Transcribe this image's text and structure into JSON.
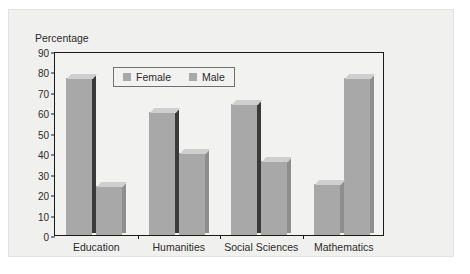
{
  "chart_data": {
    "type": "bar",
    "title": "",
    "xlabel": "",
    "ylabel": "Percentage",
    "ylim": [
      0,
      90
    ],
    "yticks": [
      90,
      80,
      70,
      60,
      50,
      40,
      30,
      20,
      10,
      0
    ],
    "grid": false,
    "legend_position": "top-left-inside",
    "categories": [
      "Education",
      "Humanities",
      "Social Sciences",
      "Mathematics"
    ],
    "series": [
      {
        "name": "Female",
        "values": [
          77,
          60,
          64,
          25
        ],
        "color": "#a8a8a8"
      },
      {
        "name": "Male",
        "values": [
          24,
          40,
          36,
          77
        ],
        "color": "#a8a8a8"
      }
    ]
  },
  "axis": {
    "y_title": "Percentage",
    "tick_labels": [
      "90",
      "80",
      "70",
      "60",
      "50",
      "40",
      "30",
      "20",
      "10",
      "0"
    ]
  },
  "legend": {
    "items": [
      {
        "label": "Female"
      },
      {
        "label": "Male"
      }
    ]
  },
  "colors": {
    "bar_face": "#a8a8a8",
    "bar_top": "#cfcfcf",
    "bar_side": "#8e8e8e",
    "bar_side_shadow": "#3a3a3a",
    "frame": "#1a1a1a",
    "panel_background": "#f0f0ee",
    "plot_background": "#f2f2f0",
    "text": "#2b2b2b"
  }
}
